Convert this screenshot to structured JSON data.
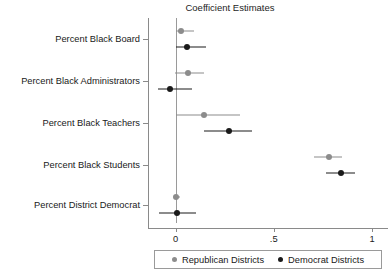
{
  "chart_data": {
    "type": "scatter",
    "title": "Coefficient Estimates",
    "xlabel": "",
    "ylabel": "",
    "xlim": [
      -0.14,
      1.05
    ],
    "xticks": [
      0,
      0.5,
      1
    ],
    "xtick_labels": [
      "0",
      ".5",
      "1"
    ],
    "grid": false,
    "zero_reference_line": 0,
    "legend_position": "bottom",
    "categories": [
      "Percent Black Board",
      "Percent Black Administrators",
      "Percent Black Teachers",
      "Percent Black Students",
      "Percent District Democrat"
    ],
    "series": [
      {
        "name": "Republican Districts",
        "color": "#8c8c8c",
        "values": [
          0.03,
          0.065,
          0.145,
          0.78,
          0.005
        ],
        "ci_low": [
          0.0,
          -0.003,
          0.005,
          0.705,
          -0.01
        ],
        "ci_high": [
          0.095,
          0.145,
          0.33,
          0.845,
          0.025
        ]
      },
      {
        "name": "Democrat Districts",
        "color": "#1a1a1a",
        "values": [
          0.06,
          -0.03,
          0.27,
          0.84,
          0.01
        ],
        "ci_low": [
          0.005,
          -0.09,
          0.145,
          0.765,
          -0.085
        ],
        "ci_high": [
          0.155,
          0.085,
          0.39,
          0.915,
          0.105
        ]
      }
    ]
  },
  "legend": {
    "items": [
      {
        "label": "Republican Districts",
        "color": "#8c8c8c"
      },
      {
        "label": "Democrat Districts",
        "color": "#1a1a1a"
      }
    ]
  }
}
